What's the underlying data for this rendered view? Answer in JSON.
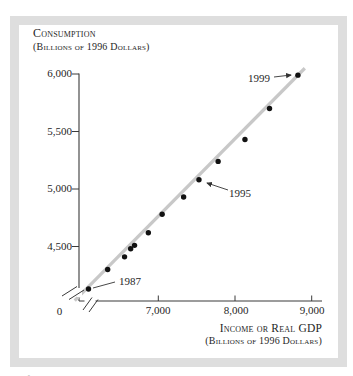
{
  "figure": {
    "y_axis_title": {
      "line1": "Consumption",
      "line2": "(Billions of 1996 Dollars)"
    },
    "x_axis_title": {
      "line1": "Income or Real GDP",
      "line2": "(Billions of 1996 Dollars)"
    },
    "caption_fragment": "Figure 10.1"
  },
  "colors": {
    "frame_border": "#dedede",
    "trend_line": "#c8c8c8",
    "dot": "#111111",
    "axis": "#3a3a3a",
    "text": "#262626"
  },
  "chart_data": {
    "type": "scatter",
    "title": "",
    "xlabel": "Income or Real GDP (billions of 1996 dollars)",
    "ylabel": "Consumption (billions of 1996 dollars)",
    "x_tick_labels": [
      "7,000",
      "8,000",
      "9,000"
    ],
    "x_tick_values": [
      7000,
      8000,
      9000
    ],
    "y_tick_labels": [
      "4,500",
      "5,000",
      "5,500",
      "6,000"
    ],
    "y_tick_values": [
      4500,
      5000,
      5500,
      6000
    ],
    "origin_label": "0",
    "xlim": [
      5900,
      9150
    ],
    "ylim": [
      4030,
      6060
    ],
    "grid": false,
    "axis_breaks": {
      "x_axis": true,
      "y_axis": true
    },
    "legend": "none",
    "series": [
      {
        "name": "US consumption vs income (real GDP) by year",
        "points": [
          {
            "year": 1987,
            "gdp": 6090,
            "consumption": 4130
          },
          {
            "year": 1988,
            "gdp": 6340,
            "consumption": 4300
          },
          {
            "year": 1989,
            "gdp": 6560,
            "consumption": 4410
          },
          {
            "year": 1990,
            "gdp": 6640,
            "consumption": 4480
          },
          {
            "year": 1991,
            "gdp": 6690,
            "consumption": 4510
          },
          {
            "year": 1992,
            "gdp": 6870,
            "consumption": 4620
          },
          {
            "year": 1993,
            "gdp": 7050,
            "consumption": 4780
          },
          {
            "year": 1994,
            "gdp": 7330,
            "consumption": 4930
          },
          {
            "year": 1995,
            "gdp": 7530,
            "consumption": 5080
          },
          {
            "year": 1996,
            "gdp": 7780,
            "consumption": 5240
          },
          {
            "year": 1997,
            "gdp": 8130,
            "consumption": 5430
          },
          {
            "year": 1998,
            "gdp": 8450,
            "consumption": 5700
          },
          {
            "year": 1999,
            "gdp": 8820,
            "consumption": 5990
          }
        ]
      }
    ],
    "trend_line": {
      "from": {
        "gdp": 5910,
        "consumption": 4030
      },
      "to": {
        "gdp": 8910,
        "consumption": 6050
      }
    },
    "annotations": [
      {
        "label": "1987",
        "year": 1987,
        "text_x": 130,
        "text_y": 281,
        "line": [
          [
            93,
            288
          ],
          [
            115,
            282
          ]
        ],
        "arrow": false
      },
      {
        "label": "1995",
        "year": 1995,
        "text_x": 240,
        "text_y": 193,
        "line": [
          [
            228,
            190
          ],
          [
            207,
            183
          ]
        ],
        "arrow": true
      },
      {
        "label": "1999",
        "year": 1999,
        "text_x": 259,
        "text_y": 78,
        "line": [
          [
            274,
            77
          ],
          [
            291,
            75
          ]
        ],
        "arrow": true
      }
    ]
  }
}
